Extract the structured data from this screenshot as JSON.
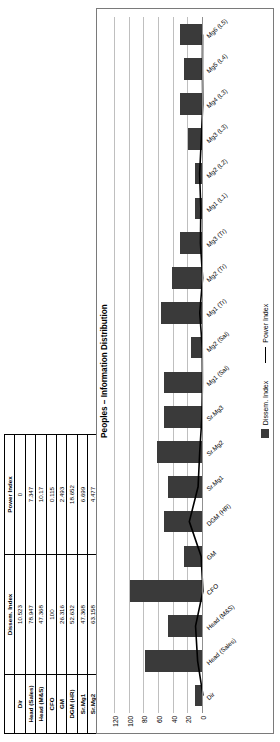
{
  "chart_data": {
    "type": "bar",
    "title": "Peoples – Information Distribution",
    "xlabel": "",
    "ylabel": "",
    "ylim": [
      0,
      120
    ],
    "yticks": [
      0,
      20,
      40,
      60,
      80,
      100,
      120
    ],
    "grid": true,
    "legend_position": "bottom",
    "categories": [
      "Dir",
      "Head (Sales)",
      "Head (M&S)",
      "CFO",
      "GM",
      "DGM (HR)",
      "Sr.Mg1",
      "Sr.Mg2",
      "Sr.Mg3",
      "Mg1 (Sal)",
      "Mg2 (Sal)",
      "Mg1 (Tr)",
      "Mg2 (Tr)",
      "Mg3 (Tr)",
      "Mg1 (L1)",
      "Mg2 (L2)",
      "Mg3 (L3)",
      "Mg4 (L3)",
      "Mg5 (L4)",
      "Mg6 (L5)"
    ],
    "series": [
      {
        "name": "Dissem. Index",
        "type": "bar",
        "values": [
          10.523,
          78.947,
          47.368,
          100,
          26.316,
          52.632,
          47.368,
          63.158,
          52.632,
          52.632,
          15.789,
          57.895,
          42.105,
          31.579,
          10.526,
          10.526,
          21.053,
          31.579,
          26.316,
          31.579
        ]
      },
      {
        "name": "Power Index",
        "type": "line",
        "values": [
          0,
          7.347,
          10.17,
          0.115,
          2.493,
          18.652,
          6.699,
          4.477,
          1.502,
          0.83,
          1.047,
          4.417,
          0.51,
          3.504,
          2.997,
          4.604,
          2.27,
          0.365,
          0.755,
          0.637
        ]
      }
    ]
  },
  "table": {
    "corner_label": "",
    "headers": [
      "",
      "Dissem. Index",
      "Power Index"
    ],
    "rows": [
      {
        "label": "Dir",
        "dissem": "10.523",
        "power": "0"
      },
      {
        "label": "Head (Sales)",
        "dissem": "78.947",
        "power": "7.347"
      },
      {
        "label": "Head (M&S)",
        "dissem": "47.368",
        "power": "10.17"
      },
      {
        "label": "CFO",
        "dissem": "100",
        "power": "0.115"
      },
      {
        "label": "GM",
        "dissem": "26.316",
        "power": "2.493"
      },
      {
        "label": "DGM (HR)",
        "dissem": "52.632",
        "power": "18.652"
      },
      {
        "label": "Sr.Mg1",
        "dissem": "47.368",
        "power": "6.699"
      },
      {
        "label": "Sr.Mg2",
        "dissem": "63.158",
        "power": "4.477"
      },
      {
        "label": "Sr.Mg3",
        "dissem": "52.632",
        "power": "1.502"
      },
      {
        "label": "Mg1 (Sal)",
        "dissem": "52.632",
        "power": "0.83"
      },
      {
        "label": "Mg2 (Sal)",
        "dissem": "15.789",
        "power": "1.047"
      },
      {
        "label": "Mg1 (Tr)",
        "dissem": "57.895",
        "power": "4.417"
      },
      {
        "label": "Mg2 (Tr)",
        "dissem": "42.105",
        "power": "0.51"
      },
      {
        "label": "Mg3 (Tr)",
        "dissem": "31.579",
        "power": "3.504"
      },
      {
        "label": "Mg1 (L1)",
        "dissem": "10.526",
        "power": "2.997"
      },
      {
        "label": "Mg2 (L2)",
        "dissem": "10.526",
        "power": "4.604"
      },
      {
        "label": "Mg3 (L3)",
        "dissem": "21.053",
        "power": "2.27"
      },
      {
        "label": "Mg4 (L3)",
        "dissem": "31.579",
        "power": "0.365"
      },
      {
        "label": "Mg5 (L4)",
        "dissem": "26.316",
        "power": "0.755"
      },
      {
        "label": "Mg6 (L5)",
        "dissem": "31.579",
        "power": "0.637"
      }
    ]
  },
  "legend": {
    "bar_label": "Dissem. Index",
    "line_label": "Power Index"
  },
  "colors": {
    "bar": "#3a3a3a",
    "line": "#000000",
    "grid": "#bfbfbf",
    "border": "#7a7a7a"
  }
}
